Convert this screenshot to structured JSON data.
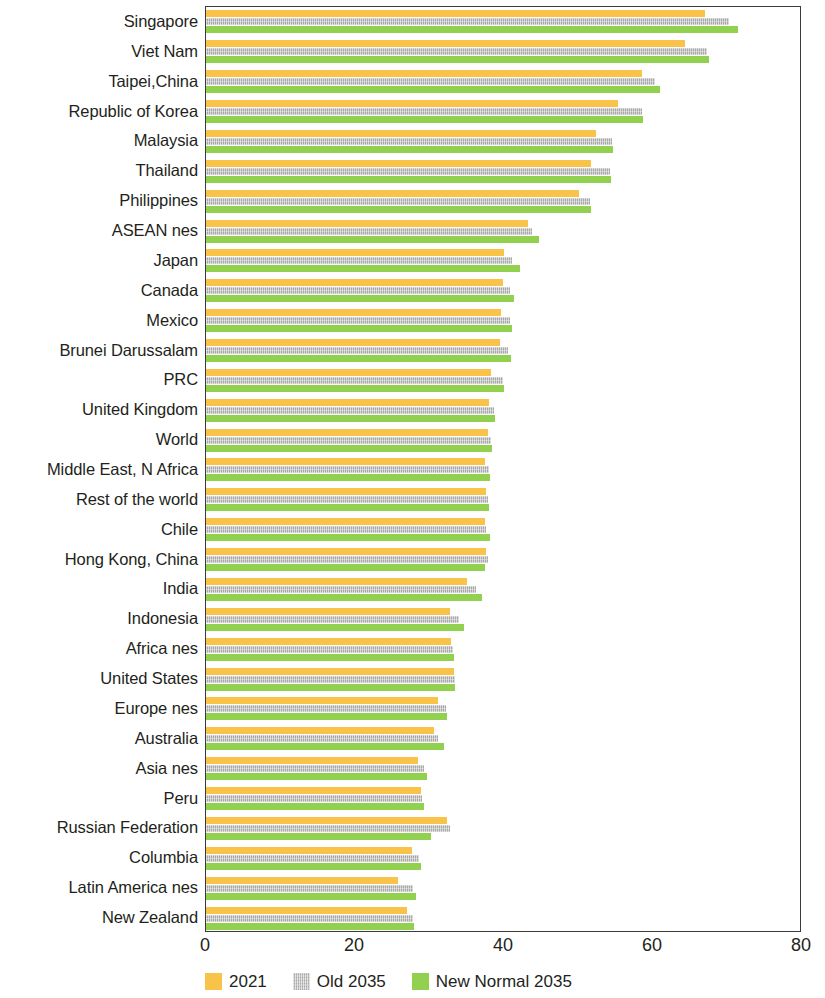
{
  "chart_data": {
    "type": "bar",
    "orientation": "horizontal",
    "title": "",
    "subtitle": "",
    "xlabel": "",
    "ylabel": "",
    "xlim": [
      0,
      80
    ],
    "xticks": [
      "0",
      "20",
      "40",
      "60",
      "80"
    ],
    "xtick_values": [
      0,
      20,
      40,
      60,
      80
    ],
    "grid": false,
    "legend_position": "bottom",
    "categories": [
      "Singapore",
      "Viet Nam",
      "Taipei,China",
      "Republic of Korea",
      "Malaysia",
      "Thailand",
      "Philippines",
      "ASEAN nes",
      "Japan",
      "Canada",
      "Mexico",
      "Brunei Darussalam",
      "PRC",
      "United Kingdom",
      "World",
      "Middle East, N Africa",
      "Rest of the world",
      "Chile",
      "Hong Kong, China",
      "India",
      "Indonesia",
      "Africa nes",
      "United States",
      "Europe nes",
      "Australia",
      "Asia nes",
      "Peru",
      "Russian Federation",
      "Columbia",
      "Latin America nes",
      "New Zealand"
    ],
    "series": [
      {
        "name": "2021",
        "color": "#f9c34a",
        "values": [
          67.0,
          64.3,
          58.5,
          55.3,
          52.4,
          51.7,
          50.1,
          43.2,
          40.0,
          39.8,
          39.6,
          39.5,
          38.2,
          38.0,
          37.8,
          37.5,
          37.6,
          37.4,
          37.6,
          35.0,
          32.8,
          32.9,
          33.3,
          31.1,
          30.6,
          28.5,
          28.8,
          32.4,
          27.6,
          25.8,
          27.0
        ]
      },
      {
        "name": "Old 2035",
        "color": "#a8a8a8",
        "values": [
          70.2,
          67.2,
          60.3,
          58.5,
          54.5,
          54.2,
          51.6,
          43.8,
          41.1,
          40.8,
          40.8,
          40.6,
          39.8,
          38.6,
          38.3,
          38.0,
          37.9,
          37.6,
          37.8,
          36.2,
          34.0,
          33.2,
          33.4,
          32.2,
          31.2,
          29.2,
          29.0,
          32.8,
          28.6,
          27.8,
          27.8
        ]
      },
      {
        "name": "New Normal 2035",
        "color": "#92d14f",
        "values": [
          71.4,
          67.5,
          60.9,
          58.6,
          54.6,
          54.3,
          51.7,
          44.7,
          42.2,
          41.3,
          41.1,
          41.0,
          40.0,
          38.8,
          38.4,
          38.1,
          38.0,
          38.1,
          37.4,
          37.0,
          34.6,
          33.3,
          33.4,
          32.4,
          32.0,
          29.6,
          29.2,
          30.2,
          28.8,
          28.2,
          27.9
        ]
      }
    ]
  },
  "legend": {
    "items": [
      {
        "label": "2021",
        "swatch": "square-swatch-orange"
      },
      {
        "label": "Old 2035",
        "swatch": "square-swatch-gray"
      },
      {
        "label": "New Normal 2035",
        "swatch": "square-swatch-green"
      }
    ]
  }
}
